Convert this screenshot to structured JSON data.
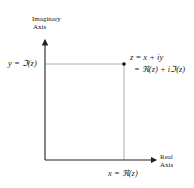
{
  "diagram": {
    "y_axis": {
      "label_line1": "Imaginary",
      "label_line2": "Axis"
    },
    "x_axis": {
      "label_line1": "Real",
      "label_line2": "Axis"
    },
    "point": {
      "label_line1": "z = x + iy",
      "label_line2": "= ℜ(z) + iℑ(z)"
    },
    "y_projection_label": "y = ℑ(z)",
    "x_projection_label": "x = ℜ(z)",
    "colors": {
      "axis": "#222222",
      "guide": "#9a9a9a",
      "point": "#111111"
    }
  }
}
